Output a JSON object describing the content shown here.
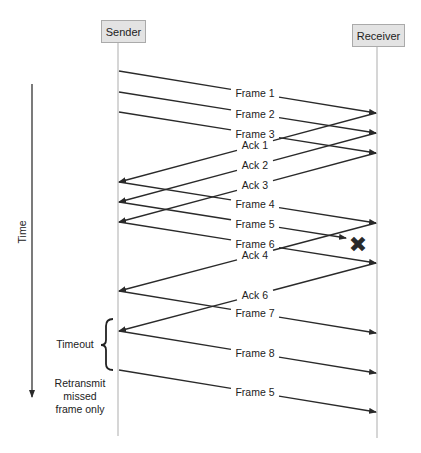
{
  "participants": {
    "sender": "Sender",
    "receiver": "Receiver"
  },
  "axis": {
    "time_label": "Time"
  },
  "annotations": {
    "timeout": "Timeout",
    "retransmit_line1": "Retransmit",
    "retransmit_line2": "missed",
    "retransmit_line3": "frame only"
  },
  "messages": [
    {
      "label": "Frame 1",
      "from": "sender",
      "y_from": 71,
      "y_to": 113
    },
    {
      "label": "Frame 2",
      "from": "sender",
      "y_from": 92,
      "y_to": 133
    },
    {
      "label": "Frame 3",
      "from": "sender",
      "y_from": 112,
      "y_to": 153
    },
    {
      "label": "Ack 1",
      "from": "receiver",
      "y_from": 113,
      "y_to": 182
    },
    {
      "label": "Ack 2",
      "from": "receiver",
      "y_from": 133,
      "y_to": 202
    },
    {
      "label": "Ack 3",
      "from": "receiver",
      "y_from": 153,
      "y_to": 222
    },
    {
      "label": "Frame 4",
      "from": "sender",
      "y_from": 182,
      "y_to": 223
    },
    {
      "label": "Frame 5",
      "from": "sender",
      "y_from": 202,
      "y_to": 238,
      "lost": true
    },
    {
      "label": "Frame 6",
      "from": "sender",
      "y_from": 222,
      "y_to": 263
    },
    {
      "label": "Ack 4",
      "from": "receiver",
      "y_from": 223,
      "y_to": 291
    },
    {
      "label": "Ack 6",
      "from": "receiver",
      "y_from": 263,
      "y_to": 331
    },
    {
      "label": "Frame 7",
      "from": "sender",
      "y_from": 291,
      "y_to": 333
    },
    {
      "label": "Frame 8",
      "from": "sender",
      "y_from": 331,
      "y_to": 373
    },
    {
      "label": "Frame 5",
      "from": "sender",
      "y_from": 370,
      "y_to": 412
    }
  ],
  "lost_marker": "✖"
}
